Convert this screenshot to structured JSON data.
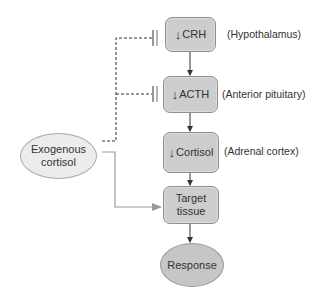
{
  "diagram": {
    "title": "",
    "nodes": {
      "crh": {
        "symbol": "↓",
        "label": "CRH",
        "annotation": "(Hypothalamus)"
      },
      "acth": {
        "symbol": "↓",
        "label": "ACTH",
        "annotation": "(Anterior pituitary)"
      },
      "cortisol": {
        "symbol": "↓",
        "label": "Cortisol",
        "annotation": "(Adrenal cortex)"
      },
      "target": {
        "line1": "Target",
        "line2": "tissue"
      },
      "response": {
        "label": "Response"
      },
      "exogenous": {
        "line1": "Exogenous",
        "line2": "cortisol"
      }
    },
    "edges": [
      {
        "from": "crh",
        "to": "acth",
        "type": "stimulate"
      },
      {
        "from": "acth",
        "to": "cortisol",
        "type": "stimulate"
      },
      {
        "from": "cortisol",
        "to": "target",
        "type": "stimulate"
      },
      {
        "from": "target",
        "to": "response",
        "type": "stimulate"
      },
      {
        "from": "exogenous",
        "to": "crh",
        "type": "inhibit",
        "style": "dashed"
      },
      {
        "from": "exogenous",
        "to": "acth",
        "type": "inhibit",
        "style": "dashed"
      },
      {
        "from": "exogenous",
        "to": "target",
        "type": "stimulate",
        "style": "solid-gray"
      }
    ],
    "colors": {
      "box_fill": "#cdcdcd",
      "box_border": "#8f8f8f",
      "exogenous_fill": "#ececec",
      "response_fill": "#c6c6c6",
      "arrow": "#333333",
      "dashed_line": "#333333",
      "gray_line": "#9a9a9a"
    }
  }
}
